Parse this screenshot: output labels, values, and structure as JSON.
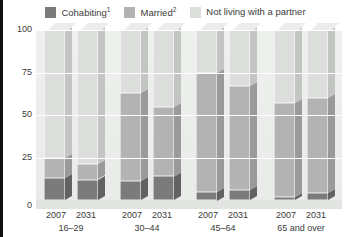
{
  "legend": {
    "items": [
      {
        "label": "Cohabiting",
        "sup": "1",
        "color": "#7b7b7b",
        "key": "cohabiting"
      },
      {
        "label": "Married",
        "sup": "2",
        "color": "#b3b3b3",
        "key": "married"
      },
      {
        "label": "Not living with a partner",
        "sup": "",
        "color": "#dcdedc",
        "key": "not_partnered"
      }
    ]
  },
  "axis": {
    "y_ticks": [
      "100",
      "75",
      "50",
      "25",
      "0"
    ],
    "y_min": 0,
    "y_max": 100
  },
  "groups": [
    {
      "age": "16–29",
      "years": [
        "2007",
        "2031"
      ]
    },
    {
      "age": "30–44",
      "years": [
        "2007",
        "2031"
      ]
    },
    {
      "age": "45–64",
      "years": [
        "2007",
        "2031"
      ]
    },
    {
      "age": "65 and over",
      "years": [
        "2007",
        "2031"
      ]
    }
  ],
  "chart_data": {
    "type": "bar",
    "title": "",
    "subtype": "stacked-100-percent-3d",
    "xlabel": "",
    "ylabel": "",
    "ylim": [
      0,
      100
    ],
    "y_ticks": [
      0,
      25,
      50,
      75,
      100
    ],
    "grid": true,
    "legend_position": "top-center",
    "categories": [
      "2007 16-29",
      "2031 16-29",
      "2007 30-44",
      "2031 30-44",
      "2007 45-64",
      "2031 45-64",
      "2007 65 and over",
      "2031 65 and over"
    ],
    "series": [
      {
        "name": "Cohabiting",
        "color": "#7b7b7b",
        "values": [
          13,
          12,
          11,
          14,
          5,
          6,
          2,
          4
        ]
      },
      {
        "name": "Married",
        "color": "#b3b3b3",
        "values": [
          12,
          9,
          52,
          41,
          70,
          61,
          55,
          56
        ]
      },
      {
        "name": "Not living with a partner",
        "color": "#dcdedc",
        "values": [
          75,
          79,
          37,
          45,
          25,
          33,
          43,
          40
        ]
      }
    ],
    "footnotes": [
      "1",
      "2"
    ]
  }
}
